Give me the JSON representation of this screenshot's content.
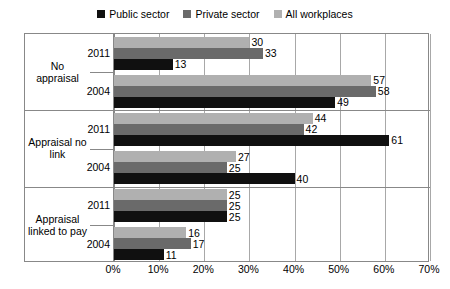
{
  "legend": {
    "items": [
      {
        "label": "Public sector",
        "color": "#101010"
      },
      {
        "label": "Private sector",
        "color": "#6a6a6a"
      },
      {
        "label": "All workplaces",
        "color": "#b0b0b0"
      }
    ]
  },
  "axis": {
    "ticks": [
      "0%",
      "10%",
      "20%",
      "30%",
      "40%",
      "50%",
      "60%",
      "70%"
    ]
  },
  "groups": [
    {
      "category": "No appraisal",
      "category_line1": "No",
      "category_line2": "appraisal",
      "years": [
        {
          "year": "2011",
          "bars": [
            {
              "series": "All workplaces",
              "value": 30,
              "label": "30",
              "color": "#b0b0b0"
            },
            {
              "series": "Private sector",
              "value": 33,
              "label": "33",
              "color": "#6a6a6a"
            },
            {
              "series": "Public sector",
              "value": 13,
              "label": "13",
              "color": "#101010"
            }
          ]
        },
        {
          "year": "2004",
          "bars": [
            {
              "series": "All workplaces",
              "value": 57,
              "label": "57",
              "color": "#b0b0b0"
            },
            {
              "series": "Private sector",
              "value": 58,
              "label": "58",
              "color": "#6a6a6a"
            },
            {
              "series": "Public sector",
              "value": 49,
              "label": "49",
              "color": "#101010"
            }
          ]
        }
      ]
    },
    {
      "category": "Appraisal no link",
      "category_line1": "Appraisal no",
      "category_line2": "link",
      "years": [
        {
          "year": "2011",
          "bars": [
            {
              "series": "All workplaces",
              "value": 44,
              "label": "44",
              "color": "#b0b0b0"
            },
            {
              "series": "Private sector",
              "value": 42,
              "label": "42",
              "color": "#6a6a6a"
            },
            {
              "series": "Public sector",
              "value": 61,
              "label": "61",
              "color": "#101010"
            }
          ]
        },
        {
          "year": "2004",
          "bars": [
            {
              "series": "All workplaces",
              "value": 27,
              "label": "27",
              "color": "#b0b0b0"
            },
            {
              "series": "Private sector",
              "value": 25,
              "label": "25",
              "color": "#6a6a6a"
            },
            {
              "series": "Public sector",
              "value": 40,
              "label": "40",
              "color": "#101010"
            }
          ]
        }
      ]
    },
    {
      "category": "Appraisal linked to pay",
      "category_line1": "Appraisal",
      "category_line2": "linked to pay",
      "years": [
        {
          "year": "2011",
          "bars": [
            {
              "series": "All workplaces",
              "value": 25,
              "label": "25",
              "color": "#b0b0b0"
            },
            {
              "series": "Private sector",
              "value": 25,
              "label": "25",
              "color": "#6a6a6a"
            },
            {
              "series": "Public sector",
              "value": 25,
              "label": "25",
              "color": "#101010"
            }
          ]
        },
        {
          "year": "2004",
          "bars": [
            {
              "series": "All workplaces",
              "value": 16,
              "label": "16",
              "color": "#b0b0b0"
            },
            {
              "series": "Private sector",
              "value": 17,
              "label": "17",
              "color": "#6a6a6a"
            },
            {
              "series": "Public sector",
              "value": 11,
              "label": "11",
              "color": "#101010"
            }
          ]
        }
      ]
    }
  ],
  "chart_data": {
    "type": "bar",
    "orientation": "horizontal",
    "title": "",
    "xlabel": "",
    "ylabel": "",
    "xlim": [
      0,
      70
    ],
    "xticks": [
      0,
      10,
      20,
      30,
      40,
      50,
      60,
      70
    ],
    "xtick_labels": [
      "0%",
      "10%",
      "20%",
      "30%",
      "40%",
      "50%",
      "60%",
      "70%"
    ],
    "grid": true,
    "legend_position": "top",
    "categories": [
      "No appraisal 2011",
      "No appraisal 2004",
      "Appraisal no link 2011",
      "Appraisal no link 2004",
      "Appraisal linked to pay 2011",
      "Appraisal linked to pay 2004"
    ],
    "series": [
      {
        "name": "Public sector",
        "color": "#101010",
        "values": [
          13,
          49,
          61,
          40,
          25,
          11
        ]
      },
      {
        "name": "Private sector",
        "color": "#6a6a6a",
        "values": [
          33,
          58,
          42,
          25,
          25,
          17
        ]
      },
      {
        "name": "All workplaces",
        "color": "#b0b0b0",
        "values": [
          30,
          57,
          44,
          27,
          25,
          16
        ]
      }
    ]
  }
}
